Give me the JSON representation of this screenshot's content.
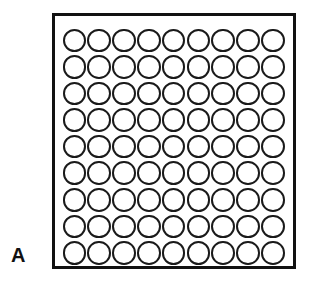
{
  "figure": {
    "panel_label": "A",
    "colors": {
      "background": "#ffffff",
      "frame_stroke": "#111111",
      "well_stroke": "#1a1a1a",
      "well_fill": "#ffffff",
      "label_color": "#111111"
    },
    "frame": {
      "shape": "square",
      "border_width_px": 3
    },
    "grid": {
      "rows": 9,
      "columns": 9,
      "total_wells": 81,
      "well_shape": "circle",
      "well_diameter_px": 24,
      "pitch_x_px": 25,
      "pitch_y_px": 27,
      "wells": [
        [
          "well",
          "well",
          "well",
          "well",
          "well",
          "well",
          "well",
          "well",
          "well"
        ],
        [
          "well",
          "well",
          "well",
          "well",
          "well",
          "well",
          "well",
          "well",
          "well"
        ],
        [
          "well",
          "well",
          "well",
          "well",
          "well",
          "well",
          "well",
          "well",
          "well"
        ],
        [
          "well",
          "well",
          "well",
          "well",
          "well",
          "well",
          "well",
          "well",
          "well"
        ],
        [
          "well",
          "well",
          "well",
          "well",
          "well",
          "well",
          "well",
          "well",
          "well"
        ],
        [
          "well",
          "well",
          "well",
          "well",
          "well",
          "well",
          "well",
          "well",
          "well"
        ],
        [
          "well",
          "well",
          "well",
          "well",
          "well",
          "well",
          "well",
          "well",
          "well"
        ],
        [
          "well",
          "well",
          "well",
          "well",
          "well",
          "well",
          "well",
          "well",
          "well"
        ],
        [
          "well",
          "well",
          "well",
          "well",
          "well",
          "well",
          "well",
          "well",
          "well"
        ]
      ]
    }
  }
}
